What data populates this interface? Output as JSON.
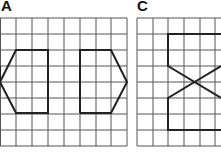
{
  "panels": [
    {
      "label": "A",
      "grid": {
        "x0": 0,
        "y0": 18,
        "cols": 8,
        "rows": 8,
        "cell": 15.7
      }
    },
    {
      "label": "C",
      "grid": {
        "x0": 137,
        "y0": 18,
        "cols": 6,
        "rows": 8,
        "cell": 15.7
      }
    }
  ],
  "colors": {
    "grid": "#444444",
    "shape": "#222222",
    "background": "#ffffff"
  }
}
